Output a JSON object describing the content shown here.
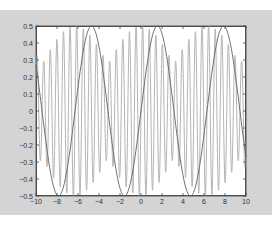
{
  "chart_data": {
    "type": "line",
    "title": "",
    "xlabel": "",
    "ylabel": "",
    "xlim": [
      -10,
      10
    ],
    "ylim": [
      -0.5,
      0.5
    ],
    "grid": false,
    "legend": null,
    "x_ticks": [
      "-10",
      "-8",
      "-6",
      "-4",
      "-2",
      "0",
      "2",
      "4",
      "6",
      "8",
      "10"
    ],
    "y_ticks": [
      "0.5",
      "0.4",
      "0.3",
      "0.2",
      "0.1",
      "0",
      "-0.1",
      "-0.2",
      "-0.3",
      "-0.4",
      "-0.5"
    ],
    "x": [
      -10,
      -9.5,
      -9,
      -8.5,
      -8,
      -7.5,
      -7,
      -6.5,
      -6,
      -5.5,
      -5,
      -4.5,
      -4,
      -3.5,
      -3,
      -2.5,
      -2,
      -1.5,
      -1,
      -0.5,
      0,
      0.5,
      1,
      1.5,
      2,
      2.5,
      3,
      3.5,
      4,
      4.5,
      5,
      5.5,
      6,
      6.5,
      7,
      7.5,
      8,
      8.5,
      9,
      9.5,
      10
    ],
    "series": [
      {
        "name": "slow sine (0.5·sin x)",
        "color": "#6e6e6e",
        "values": [
          0.27,
          0.04,
          -0.21,
          -0.4,
          -0.49,
          -0.47,
          -0.33,
          -0.11,
          0.14,
          0.35,
          0.48,
          0.49,
          0.38,
          0.18,
          -0.07,
          -0.3,
          -0.45,
          -0.5,
          -0.42,
          -0.24,
          0,
          0.24,
          0.42,
          0.5,
          0.45,
          0.3,
          0.07,
          -0.18,
          -0.38,
          -0.49,
          -0.48,
          -0.35,
          -0.14,
          0.11,
          0.33,
          0.47,
          0.49,
          0.4,
          0.21,
          -0.04,
          -0.27
        ]
      },
      {
        "name": "fast oscillation",
        "color": "#b4b4b4",
        "frequency": 10,
        "amplitude": 0.5,
        "values": [
          0.25,
          -0.3,
          0.2,
          0.38,
          -0.45,
          -0.1,
          0.4,
          -0.35,
          -0.15,
          0.45,
          -0.3,
          -0.2,
          0.45,
          -0.38,
          0.05,
          0.4,
          -0.45,
          0.2,
          0.3,
          -0.48,
          0,
          0.48,
          -0.3,
          -0.2,
          0.45,
          -0.4,
          -0.05,
          0.38,
          -0.45,
          0.2,
          0.3,
          -0.45,
          0.15,
          0.35,
          -0.4,
          0.1,
          0.45,
          -0.38,
          -0.2,
          0.3,
          -0.25
        ]
      }
    ]
  }
}
